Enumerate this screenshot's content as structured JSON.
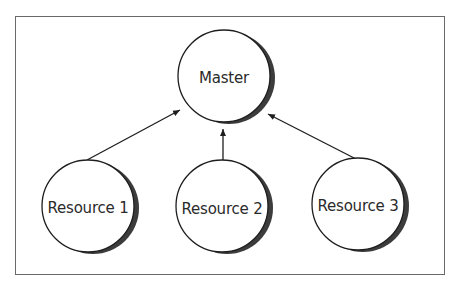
{
  "diagram": {
    "nodes": [
      {
        "id": "master",
        "label": "Master",
        "cx": 224,
        "cy": 76,
        "r": 46
      },
      {
        "id": "resource1",
        "label": "Resource 1",
        "cx": 88,
        "cy": 206,
        "r": 46
      },
      {
        "id": "resource2",
        "label": "Resource 2",
        "cx": 222,
        "cy": 206,
        "r": 46
      },
      {
        "id": "resource3",
        "label": "Resource 3",
        "cx": 358,
        "cy": 204,
        "r": 46
      }
    ],
    "edges": [
      {
        "from": "resource1",
        "to": "master"
      },
      {
        "from": "resource2",
        "to": "master"
      },
      {
        "from": "resource3",
        "to": "master"
      }
    ],
    "colors": {
      "stroke": "#1e1e1e",
      "shadow": "#3c3c3c",
      "border": "#6a6a6a",
      "fill": "#ffffff"
    }
  }
}
